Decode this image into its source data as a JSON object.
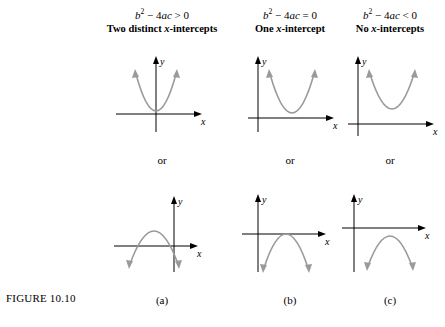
{
  "figure": {
    "label": "FIGURE 10.10"
  },
  "columns": [
    {
      "id": "a",
      "discriminant": "b² − 4ac > 0",
      "description": "Two distinct x-intercepts",
      "or_label": "or",
      "caption": "(a)",
      "top_graph": {
        "x_axis_label": "x",
        "y_axis_label": "y",
        "shape": "upward-parabola-two-roots"
      },
      "bottom_graph": {
        "x_axis_label": "x",
        "y_axis_label": "y",
        "shape": "downward-parabola-two-roots"
      }
    },
    {
      "id": "b",
      "discriminant": "b² − 4ac = 0",
      "description": "One x-intercept",
      "or_label": "or",
      "caption": "(b)",
      "top_graph": {
        "x_axis_label": "x",
        "y_axis_label": "y",
        "shape": "upward-parabola-tangent"
      },
      "bottom_graph": {
        "x_axis_label": "x",
        "y_axis_label": "y",
        "shape": "downward-parabola-tangent"
      }
    },
    {
      "id": "c",
      "discriminant": "b² − 4ac < 0",
      "description": "No x-intercepts",
      "or_label": "or",
      "caption": "(c)",
      "top_graph": {
        "x_axis_label": "x",
        "y_axis_label": "y",
        "shape": "upward-parabola-no-roots"
      },
      "bottom_graph": {
        "x_axis_label": "x",
        "y_axis_label": "y",
        "shape": "downward-parabola-no-roots"
      }
    }
  ],
  "colors": {
    "curve": "#9a9a9a",
    "axis": "#000000",
    "background": "#ffffff"
  }
}
